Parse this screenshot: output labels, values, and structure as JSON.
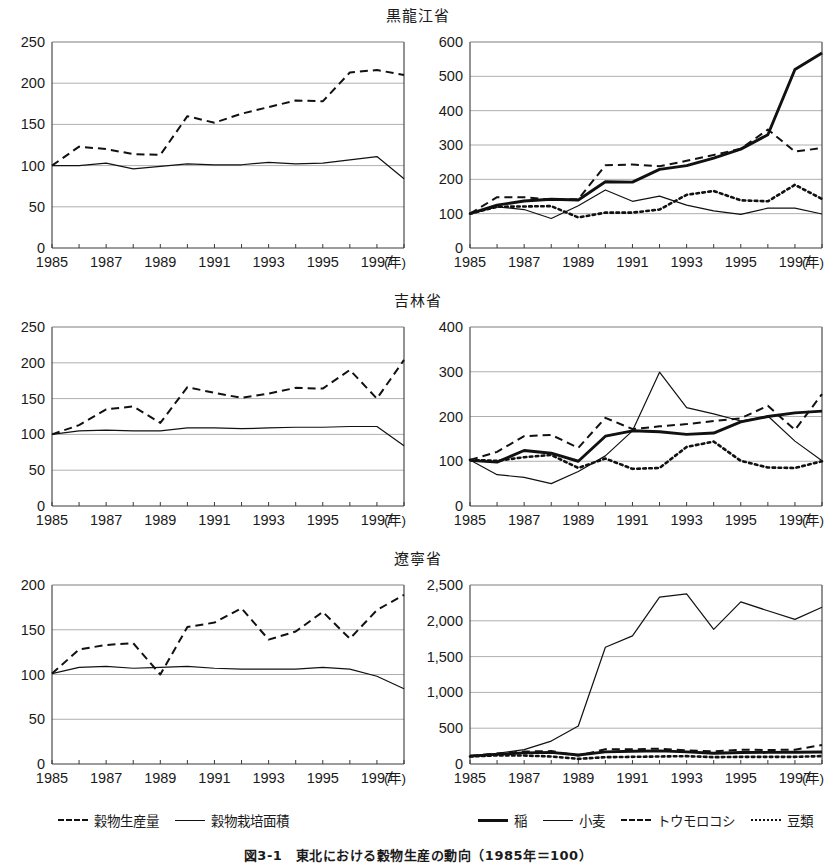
{
  "figure": {
    "caption": "図3-1　東北における穀物生産の動向（1985年＝100）"
  },
  "legends": {
    "left": [
      {
        "label": "穀物生産量",
        "style": "dashed"
      },
      {
        "label": "穀物栽培面積",
        "style": "solid-thin"
      }
    ],
    "right": [
      {
        "label": "稲",
        "style": "solid-thick"
      },
      {
        "label": "小麦",
        "style": "solid-thin"
      },
      {
        "label": "トウモロコシ",
        "style": "dashed"
      },
      {
        "label": "豆類",
        "style": "dotted"
      }
    ]
  },
  "panels": [
    {
      "province": "黒龍江省",
      "row": 0,
      "left_chart": {
        "ylim": [
          0,
          250
        ],
        "yticks": [
          0,
          50,
          100,
          150,
          200,
          250
        ],
        "ytick_labels": [
          "0",
          "50",
          "100",
          "150",
          "200",
          "250"
        ]
      },
      "right_chart": {
        "ylim": [
          0,
          600
        ],
        "yticks": [
          0,
          100,
          200,
          300,
          400,
          500,
          600
        ],
        "ytick_labels": [
          "0",
          "100",
          "200",
          "300",
          "400",
          "500",
          "600"
        ]
      }
    },
    {
      "province": "吉林省",
      "row": 1,
      "left_chart": {
        "ylim": [
          0,
          250
        ],
        "yticks": [
          0,
          50,
          100,
          150,
          200,
          250
        ],
        "ytick_labels": [
          "0",
          "50",
          "100",
          "150",
          "200",
          "250"
        ]
      },
      "right_chart": {
        "ylim": [
          0,
          400
        ],
        "yticks": [
          0,
          100,
          200,
          300,
          400
        ],
        "ytick_labels": [
          "0",
          "100",
          "200",
          "300",
          "400"
        ]
      }
    },
    {
      "province": "遼寧省",
      "row": 2,
      "left_chart": {
        "ylim": [
          0,
          200
        ],
        "yticks": [
          0,
          50,
          100,
          150,
          200
        ],
        "ytick_labels": [
          "0",
          "50",
          "100",
          "150",
          "200"
        ]
      },
      "right_chart": {
        "ylim": [
          0,
          2500
        ],
        "yticks": [
          0,
          500,
          1000,
          1500,
          2000,
          2500
        ],
        "ytick_labels": [
          "0",
          "500",
          "1,000",
          "1,500",
          "2,000",
          "2,500"
        ]
      }
    }
  ],
  "xaxis": {
    "years": [
      1985,
      1986,
      1987,
      1988,
      1989,
      1990,
      1991,
      1992,
      1993,
      1994,
      1995,
      1996,
      1997,
      1998
    ],
    "tick_labels": [
      "1985",
      "1987",
      "1989",
      "1991",
      "1993",
      "1995",
      "1997"
    ],
    "tick_years": [
      1985,
      1987,
      1989,
      1991,
      1993,
      1995,
      1997
    ],
    "unit_label": "(年)"
  },
  "chart_data": [
    {
      "id": "heilongjiang-index",
      "type": "line",
      "title": "黒龍江省",
      "xlabel": "(年)",
      "ylabel": "",
      "ylim": [
        0,
        250
      ],
      "grid": true,
      "x": [
        1985,
        1986,
        1987,
        1988,
        1989,
        1990,
        1991,
        1992,
        1993,
        1994,
        1995,
        1996,
        1997,
        1998
      ],
      "series": [
        {
          "name": "穀物生産量",
          "style": "dashed",
          "values": [
            100,
            123,
            120,
            114,
            113,
            160,
            152,
            163,
            171,
            179,
            178,
            213,
            216,
            210
          ]
        },
        {
          "name": "穀物栽培面積",
          "style": "solid-thin",
          "values": [
            100,
            100,
            103,
            96,
            99,
            102,
            101,
            101,
            104,
            102,
            103,
            107,
            111,
            84
          ]
        }
      ]
    },
    {
      "id": "heilongjiang-crops",
      "type": "line",
      "title": "黒龍江省",
      "xlabel": "(年)",
      "ylabel": "",
      "ylim": [
        0,
        600
      ],
      "grid": true,
      "x": [
        1985,
        1986,
        1987,
        1988,
        1989,
        1990,
        1991,
        1992,
        1993,
        1994,
        1995,
        1996,
        1997,
        1998
      ],
      "series": [
        {
          "name": "稲",
          "style": "solid-thick",
          "values": [
            100,
            125,
            137,
            142,
            140,
            193,
            192,
            229,
            240,
            262,
            288,
            330,
            520,
            568
          ]
        },
        {
          "name": "小麦",
          "style": "solid-thin",
          "values": [
            100,
            120,
            112,
            86,
            123,
            169,
            136,
            151,
            125,
            108,
            98,
            116,
            116,
            99
          ]
        },
        {
          "name": "トウモロコシ",
          "style": "dashed",
          "values": [
            100,
            148,
            148,
            141,
            142,
            241,
            243,
            238,
            254,
            271,
            289,
            345,
            281,
            291
          ]
        },
        {
          "name": "豆類",
          "style": "dotted",
          "values": [
            100,
            120,
            121,
            122,
            89,
            103,
            103,
            112,
            155,
            166,
            139,
            136,
            184,
            143
          ]
        }
      ]
    },
    {
      "id": "jilin-index",
      "type": "line",
      "title": "吉林省",
      "xlabel": "(年)",
      "ylabel": "",
      "ylim": [
        0,
        250
      ],
      "grid": true,
      "x": [
        1985,
        1986,
        1987,
        1988,
        1989,
        1990,
        1991,
        1992,
        1993,
        1994,
        1995,
        1996,
        1997,
        1998
      ],
      "series": [
        {
          "name": "穀物生産量",
          "style": "dashed",
          "values": [
            100,
            113,
            135,
            139,
            116,
            166,
            158,
            151,
            157,
            165,
            164,
            190,
            150,
            204
          ]
        },
        {
          "name": "穀物栽培面積",
          "style": "solid-thin",
          "values": [
            100,
            105,
            106,
            105,
            105,
            109,
            109,
            108,
            109,
            110,
            110,
            111,
            111,
            84
          ]
        }
      ]
    },
    {
      "id": "jilin-crops",
      "type": "line",
      "title": "吉林省",
      "xlabel": "(年)",
      "ylabel": "",
      "ylim": [
        0,
        400
      ],
      "grid": true,
      "x": [
        1985,
        1986,
        1987,
        1988,
        1989,
        1990,
        1991,
        1992,
        1993,
        1994,
        1995,
        1996,
        1997,
        1998
      ],
      "series": [
        {
          "name": "稲",
          "style": "solid-thick",
          "values": [
            102,
            98,
            124,
            118,
            100,
            156,
            168,
            166,
            160,
            163,
            188,
            200,
            208,
            212
          ]
        },
        {
          "name": "小麦",
          "style": "solid-thin",
          "values": [
            103,
            70,
            64,
            50,
            77,
            112,
            168,
            299,
            220,
            206,
            190,
            201,
            145,
            101
          ]
        },
        {
          "name": "トウモロコシ",
          "style": "dashed",
          "values": [
            103,
            121,
            156,
            159,
            130,
            197,
            172,
            178,
            183,
            190,
            196,
            224,
            170,
            250
          ]
        },
        {
          "name": "豆類",
          "style": "dotted",
          "values": [
            103,
            101,
            109,
            114,
            85,
            106,
            83,
            85,
            132,
            144,
            101,
            86,
            85,
            100
          ]
        }
      ]
    },
    {
      "id": "liaoning-index",
      "type": "line",
      "title": "遼寧省",
      "xlabel": "(年)",
      "ylabel": "",
      "ylim": [
        0,
        200
      ],
      "grid": true,
      "x": [
        1985,
        1986,
        1987,
        1988,
        1989,
        1990,
        1991,
        1992,
        1993,
        1994,
        1995,
        1996,
        1997,
        1998
      ],
      "series": [
        {
          "name": "穀物生産量",
          "style": "dashed",
          "values": [
            101,
            128,
            133,
            135,
            100,
            153,
            158,
            174,
            139,
            148,
            170,
            140,
            172,
            189
          ]
        },
        {
          "name": "穀物栽培面積",
          "style": "solid-thin",
          "values": [
            101,
            108,
            109,
            107,
            108,
            109,
            107,
            106,
            106,
            106,
            108,
            106,
            98,
            84
          ]
        }
      ]
    },
    {
      "id": "liaoning-crops",
      "type": "line",
      "title": "遼寧省",
      "xlabel": "(年)",
      "ylabel": "",
      "ylim": [
        0,
        2500
      ],
      "grid": true,
      "x": [
        1985,
        1986,
        1987,
        1988,
        1989,
        1990,
        1991,
        1992,
        1993,
        1994,
        1995,
        1996,
        1997,
        1998
      ],
      "series": [
        {
          "name": "稲",
          "style": "solid-thick",
          "values": [
            110,
            135,
            155,
            163,
            125,
            170,
            178,
            183,
            170,
            150,
            160,
            162,
            165,
            168
          ]
        },
        {
          "name": "小麦",
          "style": "solid-thin",
          "values": [
            110,
            150,
            200,
            320,
            530,
            1630,
            1790,
            2330,
            2375,
            1880,
            2265,
            2140,
            2020,
            2190
          ]
        },
        {
          "name": "トウモロコシ",
          "style": "dashed",
          "values": [
            115,
            145,
            175,
            180,
            120,
            205,
            205,
            215,
            190,
            175,
            200,
            195,
            200,
            265
          ]
        },
        {
          "name": "豆類",
          "style": "dotted",
          "values": [
            105,
            120,
            118,
            105,
            72,
            95,
            100,
            105,
            110,
            95,
            100,
            100,
            100,
            110
          ]
        }
      ]
    }
  ]
}
